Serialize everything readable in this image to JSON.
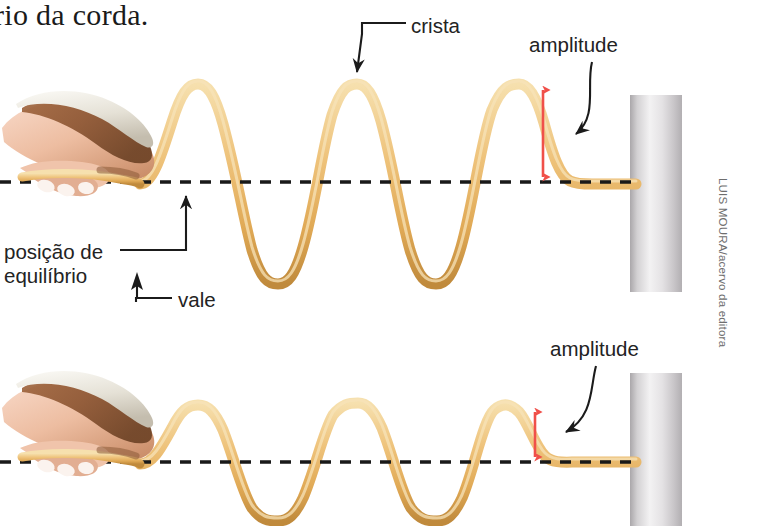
{
  "figure": {
    "title_fragment": "rio da corda.",
    "credit": "LUIS MOURA/acervo da editora",
    "labels": {
      "crest": "crista",
      "amplitude_top": "amplitude",
      "equilibrium_line1": "posição de",
      "equilibrium_line2": "equilíbrio",
      "trough": "vale",
      "amplitude_bottom": "amplitude"
    },
    "colors": {
      "rope": "#e8b869",
      "rope_light": "#f4d9a4",
      "rope_shadow": "#c8913f",
      "arrow_red": "#f0504a",
      "leader_black": "#1b1b1b",
      "dashed_line": "#191919",
      "pole_light": "#f2f1f2",
      "pole_mid": "#d8d6d8",
      "pole_dark": "#a9a6a9",
      "skin": "#f0c4ab",
      "skin_shadow": "#b8795a",
      "sleeve": "#e6e3db",
      "text": "#232323"
    },
    "icons": {
      "hand_top": "hand-holding-rope-icon",
      "hand_bottom": "hand-holding-rope-icon",
      "pole_top": "wall-pole-icon",
      "pole_bottom": "wall-pole-icon"
    },
    "geometry": {
      "top_diagram": {
        "equilibrium_y": 182,
        "crest_y": 84,
        "trough_y": 283,
        "amplitude_px": 98,
        "wave_start_x": 140,
        "wave_end_x": 636,
        "amplitude_arrow_x": 543
      },
      "bottom_diagram": {
        "equilibrium_y": 462,
        "crest_y": 405,
        "trough_y": 518,
        "amplitude_px": 57,
        "wave_start_x": 140,
        "wave_end_x": 636,
        "amplitude_arrow_x": 535
      }
    }
  }
}
